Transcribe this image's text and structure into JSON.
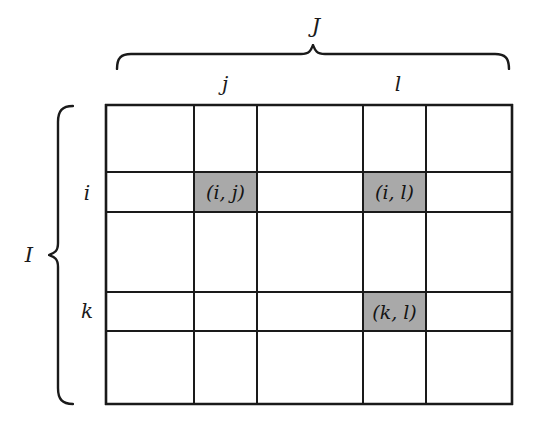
{
  "figure": {
    "background_color": "#ffffff",
    "line_color": "#1a1a1a",
    "shaded_cell_color": "#a9a9a9"
  },
  "top_brace": {
    "label": "J",
    "icon": "horizontal-curly-brace-icon"
  },
  "left_brace": {
    "label": "I",
    "icon": "vertical-curly-brace-icon"
  },
  "column_labels": [
    {
      "text": "j",
      "left": 205
    },
    {
      "text": "l",
      "left": 378
    }
  ],
  "row_labels": [
    {
      "text": "i",
      "top": 182
    },
    {
      "text": "k",
      "top": 300
    }
  ],
  "grid": {
    "columns": 5,
    "rows": 5,
    "col_edges": [
      0,
      89,
      152,
      258,
      321,
      408
    ],
    "row_edges": [
      0,
      68,
      108,
      188,
      227,
      301
    ],
    "cells": [
      {
        "row": 1,
        "col": 1,
        "shaded": false,
        "label": ""
      },
      {
        "row": 1,
        "col": 2,
        "shaded": false,
        "label": ""
      },
      {
        "row": 1,
        "col": 3,
        "shaded": false,
        "label": ""
      },
      {
        "row": 1,
        "col": 4,
        "shaded": false,
        "label": ""
      },
      {
        "row": 1,
        "col": 5,
        "shaded": false,
        "label": ""
      },
      {
        "row": 2,
        "col": 1,
        "shaded": false,
        "label": ""
      },
      {
        "row": 2,
        "col": 2,
        "shaded": true,
        "label": "(i, j)"
      },
      {
        "row": 2,
        "col": 3,
        "shaded": false,
        "label": ""
      },
      {
        "row": 2,
        "col": 4,
        "shaded": true,
        "label": "(i, l)"
      },
      {
        "row": 2,
        "col": 5,
        "shaded": false,
        "label": ""
      },
      {
        "row": 3,
        "col": 1,
        "shaded": false,
        "label": ""
      },
      {
        "row": 3,
        "col": 2,
        "shaded": false,
        "label": ""
      },
      {
        "row": 3,
        "col": 3,
        "shaded": false,
        "label": ""
      },
      {
        "row": 3,
        "col": 4,
        "shaded": false,
        "label": ""
      },
      {
        "row": 3,
        "col": 5,
        "shaded": false,
        "label": ""
      },
      {
        "row": 4,
        "col": 1,
        "shaded": false,
        "label": ""
      },
      {
        "row": 4,
        "col": 2,
        "shaded": false,
        "label": ""
      },
      {
        "row": 4,
        "col": 3,
        "shaded": false,
        "label": ""
      },
      {
        "row": 4,
        "col": 4,
        "shaded": true,
        "label": "(k, l)"
      },
      {
        "row": 4,
        "col": 5,
        "shaded": false,
        "label": ""
      },
      {
        "row": 5,
        "col": 1,
        "shaded": false,
        "label": ""
      },
      {
        "row": 5,
        "col": 2,
        "shaded": false,
        "label": ""
      },
      {
        "row": 5,
        "col": 3,
        "shaded": false,
        "label": ""
      },
      {
        "row": 5,
        "col": 4,
        "shaded": false,
        "label": ""
      },
      {
        "row": 5,
        "col": 5,
        "shaded": false,
        "label": ""
      }
    ]
  }
}
